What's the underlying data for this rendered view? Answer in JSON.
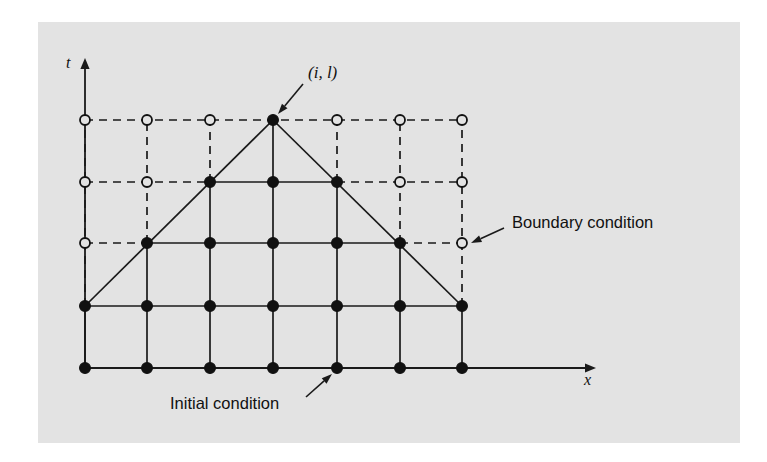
{
  "figure": {
    "kind": "finite-difference-grid-diagram",
    "panel": {
      "background_color": "#e3e3e3",
      "page_color": "#ffffff",
      "x": 38,
      "y": 22,
      "width": 702,
      "height": 421
    },
    "axes": {
      "t_axis": {
        "label": "t",
        "label_x": 66,
        "label_y": 68,
        "line_x": 85,
        "line_top_y": 58,
        "line_bottom_y": 368
      },
      "x_axis": {
        "label": "x",
        "label_x": 584,
        "label_y": 385,
        "line_y": 368,
        "line_left_x": 85,
        "line_right_x": 596
      },
      "ink_color": "#1a1a1a"
    },
    "grid": {
      "columns_x": [
        85,
        147,
        210,
        273,
        337,
        400,
        462
      ],
      "rows_y": [
        368,
        306,
        243,
        182,
        120
      ],
      "n_columns": 7,
      "n_rows": 5,
      "description": "row 0 is bottom (initial condition), row 4 is top"
    },
    "nodes": {
      "filled_color": "#111111",
      "open_color": "#e3e3e3",
      "filled_radius": 5.4,
      "open_radius": 5.0,
      "rows": [
        {
          "row": 0,
          "y": 368,
          "states": [
            "filled",
            "filled",
            "filled",
            "filled",
            "filled",
            "filled",
            "filled"
          ]
        },
        {
          "row": 1,
          "y": 306,
          "states": [
            "filled",
            "filled",
            "filled",
            "filled",
            "filled",
            "filled",
            "filled"
          ]
        },
        {
          "row": 2,
          "y": 243,
          "states": [
            "open",
            "filled",
            "filled",
            "filled",
            "filled",
            "filled",
            "open"
          ]
        },
        {
          "row": 3,
          "y": 182,
          "states": [
            "open",
            "open",
            "filled",
            "filled",
            "filled",
            "open",
            "open"
          ]
        },
        {
          "row": 4,
          "y": 120,
          "states": [
            "open",
            "open",
            "open",
            "filled",
            "open",
            "open",
            "open"
          ]
        }
      ]
    },
    "edges": {
      "solid_description": "interior domain of dependence edges drawn solid",
      "dashed_description": "edges outside the domain of dependence drawn dashed",
      "horizontal_solid_spans": [
        {
          "y": 368,
          "from_col": 0,
          "to_col": 6
        },
        {
          "y": 306,
          "from_col": 0,
          "to_col": 6
        },
        {
          "y": 243,
          "from_col": 1,
          "to_col": 5
        },
        {
          "y": 182,
          "from_col": 2,
          "to_col": 4
        }
      ],
      "horizontal_dashed_spans": [
        {
          "y": 243,
          "from_col": 0,
          "to_col": 1
        },
        {
          "y": 243,
          "from_col": 5,
          "to_col": 6
        },
        {
          "y": 182,
          "from_col": 0,
          "to_col": 2
        },
        {
          "y": 182,
          "from_col": 4,
          "to_col": 6
        },
        {
          "y": 120,
          "from_col": 0,
          "to_col": 6
        }
      ],
      "vertical_solid_spans": [
        {
          "col": 0,
          "from_row": 0,
          "to_row": 1
        },
        {
          "col": 1,
          "from_row": 0,
          "to_row": 2
        },
        {
          "col": 2,
          "from_row": 0,
          "to_row": 3
        },
        {
          "col": 3,
          "from_row": 0,
          "to_row": 4
        },
        {
          "col": 4,
          "from_row": 0,
          "to_row": 3
        },
        {
          "col": 5,
          "from_row": 0,
          "to_row": 2
        },
        {
          "col": 6,
          "from_row": 0,
          "to_row": 1
        }
      ],
      "vertical_dashed_spans": [
        {
          "col": 0,
          "from_row": 1,
          "to_row": 4
        },
        {
          "col": 1,
          "from_row": 2,
          "to_row": 4
        },
        {
          "col": 2,
          "from_row": 3,
          "to_row": 4
        },
        {
          "col": 4,
          "from_row": 3,
          "to_row": 4
        },
        {
          "col": 5,
          "from_row": 2,
          "to_row": 4
        },
        {
          "col": 6,
          "from_row": 1,
          "to_row": 4
        }
      ],
      "characteristic_lines": [
        {
          "name": "left-characteristic",
          "x1": 85,
          "y1": 306,
          "x2": 273,
          "y2": 120
        },
        {
          "name": "right-characteristic",
          "x1": 273,
          "y1": 120,
          "x2": 462,
          "y2": 306
        }
      ]
    },
    "annotations": [
      {
        "id": "apex-node-label",
        "text": "(i, l)",
        "style": "italic-serif",
        "text_x": 308,
        "text_y": 78,
        "arrow": {
          "x1": 303,
          "y1": 84,
          "x2": 278,
          "y2": 114
        }
      },
      {
        "id": "boundary-condition-label",
        "text": "Boundary condition",
        "style": "sans",
        "text_x": 512,
        "text_y": 228,
        "arrow": {
          "x1": 504,
          "y1": 228,
          "x2": 471,
          "y2": 243
        }
      },
      {
        "id": "initial-condition-label",
        "text": "Initial condition",
        "style": "sans",
        "text_x": 170,
        "text_y": 409,
        "arrow": {
          "x1": 306,
          "y1": 397,
          "x2": 332,
          "y2": 374
        }
      }
    ]
  }
}
